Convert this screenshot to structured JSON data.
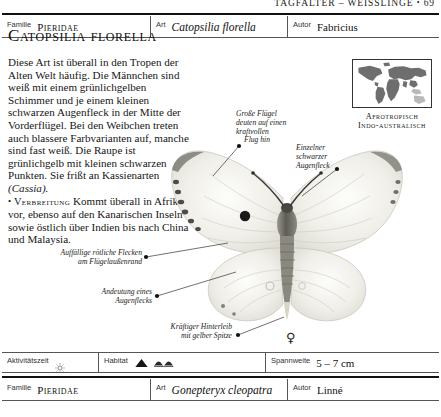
{
  "running_head": {
    "text": "TAGFALTER – WEISSLINGE",
    "bullet": "•",
    "page_number": "69"
  },
  "taxon_header": {
    "familie_label": "Familie",
    "familie_value": "Pieridae",
    "art_label": "Art",
    "art_value": "Catopsilia florella",
    "autor_label": "Autor",
    "autor_value": "Fabricius"
  },
  "species": {
    "heading": "Catopsilia florella",
    "description_p1": "Diese Art ist überall in den Tropen der Alten Welt häufig. Die Männchen sind weiß mit einem grünlichgelben Schimmer und je einem kleinen schwarzen Augenfleck in der Mitte der Vorderflügel. Bei den Weibchen treten auch blassere Farbvarianten auf, manche sind fast weiß. Die Raupe ist grünlichgelb mit kleinen schwarzen Punkten. Sie frißt an Kassienarten",
    "description_p1_italic": "(Cassia).",
    "distribution_bullet": "•",
    "distribution_label": "Verbreitung",
    "distribution_text": "Kommt überall in Afrika vor, ebenso auf den Kanarischen Inseln sowie östlich über Indien bis nach China und Malaysia."
  },
  "map": {
    "caption_line1": "Afrotropisch",
    "caption_line2": "Indo-australisch",
    "land_color": "#6e6e6e",
    "highlight_color": "#b9b9b9",
    "border_color": "#333333"
  },
  "plate": {
    "sex_symbol": "♀",
    "specimen_name": "catopsilia-florella-female"
  },
  "callouts": [
    {
      "id": "large-wings",
      "lines": [
        "Große Flügel",
        "deuten auf einen",
        "kraftvollen",
        "Flug hin"
      ]
    },
    {
      "id": "single-black-eyespot",
      "lines": [
        "Einzelner",
        "schwarzer",
        "Augenfleck"
      ]
    },
    {
      "id": "reddish-spots",
      "lines": [
        "Auffällige rötliche Flecken",
        "am Flügelaußenrand"
      ]
    },
    {
      "id": "hint-of-eyespot",
      "lines": [
        "Andeutung eines",
        "Augenflecks"
      ]
    },
    {
      "id": "strong-abdomen",
      "lines": [
        "Kräftiger Hinterleib",
        "mit gelber Spitze"
      ]
    }
  ],
  "attributes": {
    "activity_label": "Aktivitätszeit",
    "activity_icon": "sun-icon",
    "habitat_label": "Habitat",
    "habitat_icons": [
      "mountain-peak-icon",
      "low-hills-icon"
    ],
    "wingspan_label": "Spannweite",
    "wingspan_value": "5 – 7 cm"
  },
  "next_entry": {
    "familie_label": "Familie",
    "familie_value": "Pieridae",
    "art_label": "Art",
    "art_value": "Gonepteryx cleopatra",
    "autor_label": "Autor",
    "autor_value": "Linné"
  }
}
